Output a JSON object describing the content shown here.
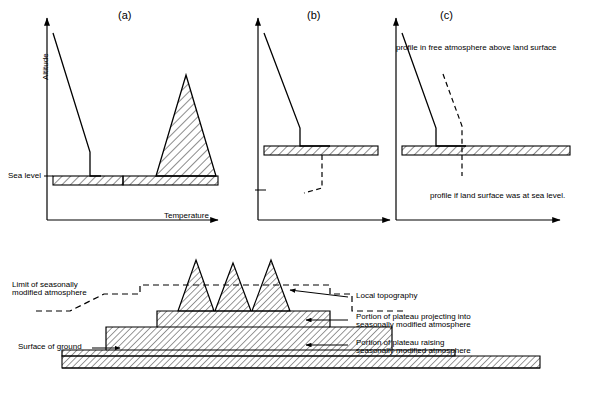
{
  "figure": {
    "panels": [
      {
        "id": "a",
        "letter": "(a)"
      },
      {
        "id": "b",
        "letter": "(b)"
      },
      {
        "id": "c",
        "letter": "(c)"
      }
    ],
    "axes": {
      "y_label": "Altitude",
      "x_label": "Temperature",
      "sea_level_label": "Sea level"
    },
    "annotations": {
      "free_atmosphere": "profile in free atmosphere above land surface",
      "sea_level_profile": "profile if land surface was at sea level.",
      "limit_modified_atmosphere": "Limit of seasonally\nmodified atmosphere",
      "local_topography": "Local topography",
      "plateau_projecting": "Portion of plateau projecting into\nseasonally modified atmosphere",
      "plateau_raising": "Portion of plateau raising\nseasonally modified atmosphere",
      "surface_of_ground": "Surface of ground"
    },
    "colors": {
      "ink": "#000000",
      "background": "#ffffff"
    }
  }
}
